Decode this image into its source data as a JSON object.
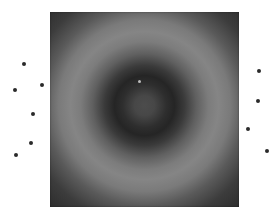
{
  "image": {
    "description": "Grayscale concentric ring interference pattern with surrounding point markers",
    "pattern": {
      "left": 50,
      "top": 12,
      "width": 189,
      "height": 195,
      "center_spot": {
        "x": 139,
        "y": 81,
        "color": "#bdbdbd"
      }
    },
    "colors": {
      "background": "#ffffff",
      "ring_bright": "#858585",
      "ring_dark": "#252525",
      "corner": "#2c2c2c",
      "marker": "#2a2a2a"
    },
    "markers_left": [
      {
        "x": 24,
        "y": 64
      },
      {
        "x": 42,
        "y": 85
      },
      {
        "x": 15,
        "y": 90
      },
      {
        "x": 33,
        "y": 114
      },
      {
        "x": 31,
        "y": 143
      },
      {
        "x": 16,
        "y": 155
      }
    ],
    "markers_right": [
      {
        "x": 259,
        "y": 71
      },
      {
        "x": 258,
        "y": 101
      },
      {
        "x": 248,
        "y": 129
      },
      {
        "x": 267,
        "y": 151
      }
    ]
  }
}
